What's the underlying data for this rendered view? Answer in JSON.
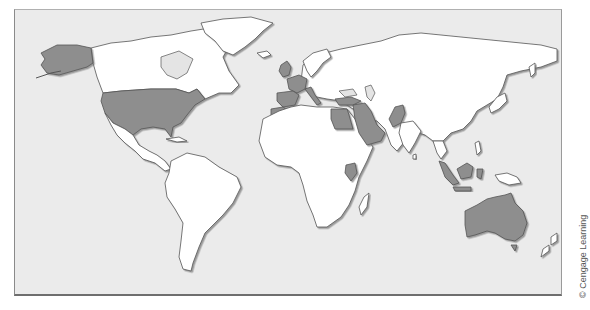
{
  "map": {
    "title": "World map with highlighted countries",
    "colors": {
      "ocean": "#ebebeb",
      "land": "#ffffff",
      "highlighted": "#8e8e8e",
      "outline": "#555555"
    },
    "highlighted_regions": [
      "Alaska (United States)",
      "United States",
      "United Kingdom",
      "France",
      "Spain",
      "Portugal",
      "Italy",
      "Morocco",
      "Egypt",
      "Turkey",
      "Iraq",
      "Saudi Arabia",
      "Pakistan",
      "Kenya",
      "Malaysia",
      "Indonesia (Borneo)",
      "Australia"
    ]
  },
  "credit": "© Cengage Learning"
}
